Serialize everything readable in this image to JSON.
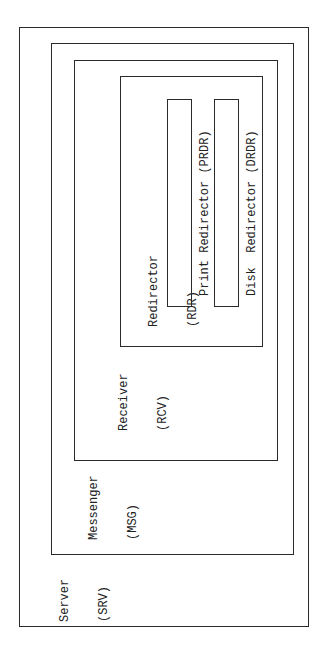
{
  "diagram": {
    "type": "nested-containment",
    "orientation": "rotated-90-ccw",
    "line_color": "#2a2a2a",
    "text_color": "#222222",
    "background": "#ffffff",
    "boxes": {
      "server": {
        "name": "Server",
        "abbr": "(SRV)"
      },
      "messenger": {
        "name": "Messenger",
        "abbr": "(MSG)"
      },
      "receiver": {
        "name": "Receiver",
        "abbr": "(RCV)"
      },
      "redirector": {
        "name": "Redirector",
        "abbr": "(RDR)"
      },
      "print_redirector": {
        "label": "Print Redirector (PRDR)"
      },
      "disk_redirector": {
        "label": "Disk  Redirector (DRDR)"
      }
    }
  }
}
